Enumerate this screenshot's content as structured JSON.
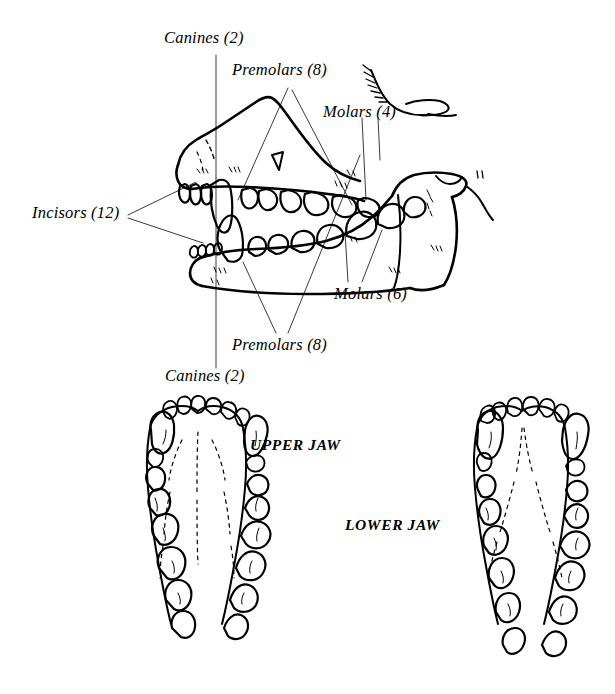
{
  "figure": {
    "background_color": "#ffffff",
    "ink_color": "#000000",
    "leader_color": "#3a3a3a",
    "width": 615,
    "height": 694
  },
  "labels": {
    "canines_top": "Canines (2)",
    "premolars_top": "Premolars (8)",
    "molars_upper": "Molars (4)",
    "incisors": "Incisors (12)",
    "molars_lower": "Molars (6)",
    "premolars_bottom": "Premolars (8)",
    "canines_bottom": "Canines (2)",
    "upper_jaw": "UPPER JAW",
    "lower_jaw": "LOWER JAW"
  },
  "dentition": {
    "incisors_total": 12,
    "canines_total": 2,
    "premolars_upper": 8,
    "premolars_lower": 8,
    "molars_upper": 4,
    "molars_lower": 6
  },
  "views": {
    "lateral_skull": "lateral-skull-view",
    "upper_jaw": "upper-jaw-occlusal-view",
    "lower_jaw": "lower-jaw-occlusal-view"
  }
}
